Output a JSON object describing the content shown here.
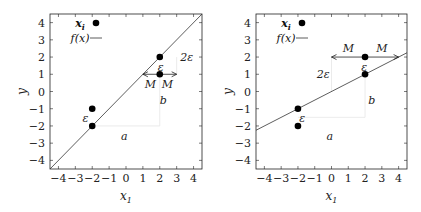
{
  "chart_data": [
    {
      "type": "scatter",
      "panel": "left",
      "xlabel": "x_1",
      "ylabel": "y",
      "xlim": [
        -4.5,
        4.5
      ],
      "ylim": [
        -4.5,
        4.5
      ],
      "xticks": [
        -4,
        -3,
        -2,
        -1,
        0,
        1,
        2,
        3,
        4
      ],
      "yticks": [
        -4,
        -3,
        -2,
        -1,
        0,
        1,
        2,
        3,
        4
      ],
      "grid": false,
      "legend": {
        "position": "upper-left",
        "entries": [
          "x_i",
          "f(x)"
        ]
      },
      "series": [
        {
          "name": "x_i",
          "kind": "points",
          "x": [
            -2,
            -2,
            2,
            2
          ],
          "y": [
            -1,
            -2,
            2,
            1
          ]
        },
        {
          "name": "f(x)",
          "kind": "line",
          "x": [
            -4.5,
            4.5
          ],
          "y": [
            -4.5,
            4.5
          ],
          "slope": 1,
          "intercept": 0
        }
      ],
      "annotations": [
        {
          "text": "ε",
          "x": -2.4,
          "y": -1.55
        },
        {
          "text": "ε",
          "x": 2.05,
          "y": 1.45
        },
        {
          "text": "2ε",
          "x": 3.6,
          "y": 2.0
        },
        {
          "text": "M",
          "x": 1.45,
          "y": 0.45
        },
        {
          "text": "M",
          "x": 2.45,
          "y": 0.45
        },
        {
          "text": "a",
          "x": -0.1,
          "y": -2.6
        },
        {
          "text": "b",
          "x": 2.2,
          "y": -0.5
        },
        {
          "text": "arrow-double",
          "x_from": 1,
          "x_to": 3,
          "y": 1
        }
      ]
    },
    {
      "type": "scatter",
      "panel": "right",
      "xlabel": "x_1",
      "ylabel": "y",
      "xlim": [
        -4.5,
        4.5
      ],
      "ylim": [
        -4.5,
        4.5
      ],
      "xticks": [
        -4,
        -3,
        -2,
        -1,
        0,
        1,
        2,
        3,
        4
      ],
      "yticks": [
        -4,
        -3,
        -2,
        -1,
        0,
        1,
        2,
        3,
        4
      ],
      "grid": false,
      "legend": {
        "position": "upper-left",
        "entries": [
          "x_i",
          "f(x)"
        ]
      },
      "series": [
        {
          "name": "x_i",
          "kind": "points",
          "x": [
            -2,
            -2,
            2,
            2
          ],
          "y": [
            -1,
            -2,
            2,
            1
          ]
        },
        {
          "name": "f(x)",
          "kind": "line",
          "x": [
            -4.5,
            4.5
          ],
          "y": [
            -2.25,
            2.25
          ],
          "slope": 0.5,
          "intercept": 0
        }
      ],
      "annotations": [
        {
          "text": "ε",
          "x": -1.75,
          "y": -1.55
        },
        {
          "text": "ε",
          "x": 1.95,
          "y": 1.45
        },
        {
          "text": "2ε",
          "x": -0.5,
          "y": 1.0
        },
        {
          "text": "M",
          "x": 1.0,
          "y": 2.55
        },
        {
          "text": "M",
          "x": 3.0,
          "y": 2.55
        },
        {
          "text": "a",
          "x": -0.1,
          "y": -2.6
        },
        {
          "text": "b",
          "x": 2.4,
          "y": -0.5
        },
        {
          "text": "arrow-double",
          "x_from": 0,
          "x_to": 4,
          "y": 2
        }
      ]
    }
  ],
  "labels": {
    "xlabel": "x",
    "xlabel_sub": "1",
    "ylabel": "y",
    "legend_points": "x",
    "legend_points_sub": "i",
    "legend_line": "f(x)",
    "eps": "ε",
    "two_eps": "2ε",
    "M": "M",
    "a": "a",
    "b": "b"
  },
  "ticks": [
    "−4",
    "−3",
    "−2",
    "−1",
    "0",
    "1",
    "2",
    "3",
    "4"
  ],
  "colors": {
    "axis": "#222222",
    "line": "#333333",
    "point": "#000000",
    "guide": "#e6e6e6"
  }
}
